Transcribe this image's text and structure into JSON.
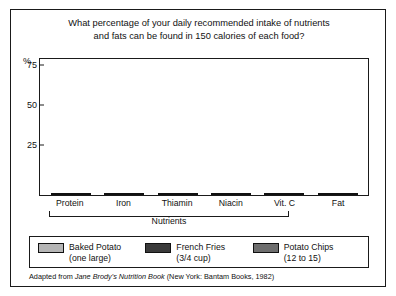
{
  "figure": {
    "title_line1": "What percentage of your daily recommended  intake of nutrients",
    "title_line2": "and fats can be found in 150 calories of each food?",
    "percent_symbol": "%",
    "bracket_label": "Nutrients",
    "source_prefix": "Adapted from ",
    "source_italic": "Jane Brody's Nutrition Book",
    "source_suffix": " (New York:  Bantam Books, 1982)"
  },
  "legend": [
    {
      "name": "Baked Potato",
      "sub": "(one large)",
      "color": "#b5b5b5"
    },
    {
      "name": "French Fries",
      "sub": "(3/4 cup)",
      "color": "#3a3a3a"
    },
    {
      "name": "Potato Chips",
      "sub": "(12 to 15)",
      "color": "#6e6e6e"
    }
  ],
  "chart_data": {
    "type": "bar",
    "title": "What percentage of your daily recommended  intake of nutrients and fats can be found in 150 calories of each food?",
    "xlabel": "Nutrients",
    "ylabel": "%",
    "ylim": [
      0,
      85
    ],
    "yticks": [
      25,
      50,
      75
    ],
    "grid": false,
    "legend_position": "bottom",
    "categories": [
      "Protein",
      "Iron",
      "Thiamin",
      "Niacin",
      "Vit. C",
      "Fat"
    ],
    "series": [
      {
        "name": "Baked Potato",
        "color": "#b5b5b5",
        "values": [
          12,
          10,
          18,
          21,
          75,
          1
        ]
      },
      {
        "name": "French Fries",
        "color": "#3a3a3a",
        "values": [
          8,
          7,
          9,
          19,
          21,
          9
        ]
      },
      {
        "name": "Potato Chips",
        "color": "#6e6e6e",
        "values": [
          6,
          5,
          6,
          12,
          15,
          12
        ]
      }
    ]
  }
}
